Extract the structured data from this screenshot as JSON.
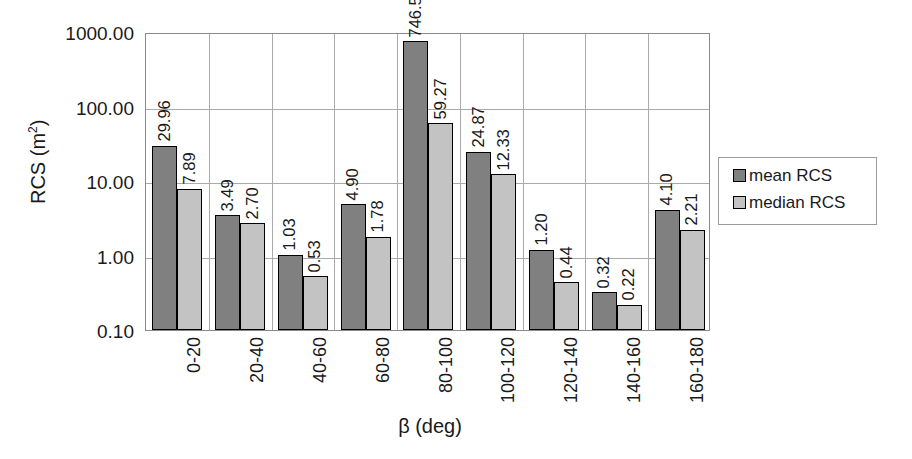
{
  "chart_data": {
    "type": "bar",
    "title": "",
    "xlabel": "β (deg)",
    "ylabel": "RCS (m²)",
    "ylabel_base": "RCS (m",
    "ylabel_sup": "2",
    "ylabel_tail": ")",
    "yscale": "log",
    "ylim": [
      0.1,
      1000.0
    ],
    "grid": true,
    "legend_position": "right",
    "categories": [
      "0-20",
      "20-40",
      "40-60",
      "60-80",
      "80-100",
      "100-120",
      "120-140",
      "140-160",
      "160-180"
    ],
    "ytick_labels": [
      "0.10",
      "1.00",
      "10.00",
      "100.00",
      "1000.00"
    ],
    "ytick_values": [
      0.1,
      1.0,
      10.0,
      100.0,
      1000.0
    ],
    "series": [
      {
        "name": "mean RCS",
        "color": "#808080",
        "values": [
          29.96,
          3.49,
          1.03,
          4.9,
          746.52,
          24.87,
          1.2,
          0.32,
          4.1
        ],
        "labels": [
          "29.96",
          "3.49",
          "1.03",
          "4.90",
          "746.52",
          "24.87",
          "1.20",
          "0.32",
          "4.10"
        ]
      },
      {
        "name": "median RCS",
        "color": "#c3c3c3",
        "values": [
          7.89,
          2.7,
          0.53,
          1.78,
          59.27,
          12.33,
          0.44,
          0.22,
          2.21
        ],
        "labels": [
          "7.89",
          "2.70",
          "0.53",
          "1.78",
          "59.27",
          "12.33",
          "0.44",
          "0.22",
          "2.21"
        ]
      }
    ]
  },
  "legend": {
    "items": [
      {
        "label": "mean RCS",
        "color": "#808080"
      },
      {
        "label": "median RCS",
        "color": "#c3c3c3"
      }
    ]
  }
}
